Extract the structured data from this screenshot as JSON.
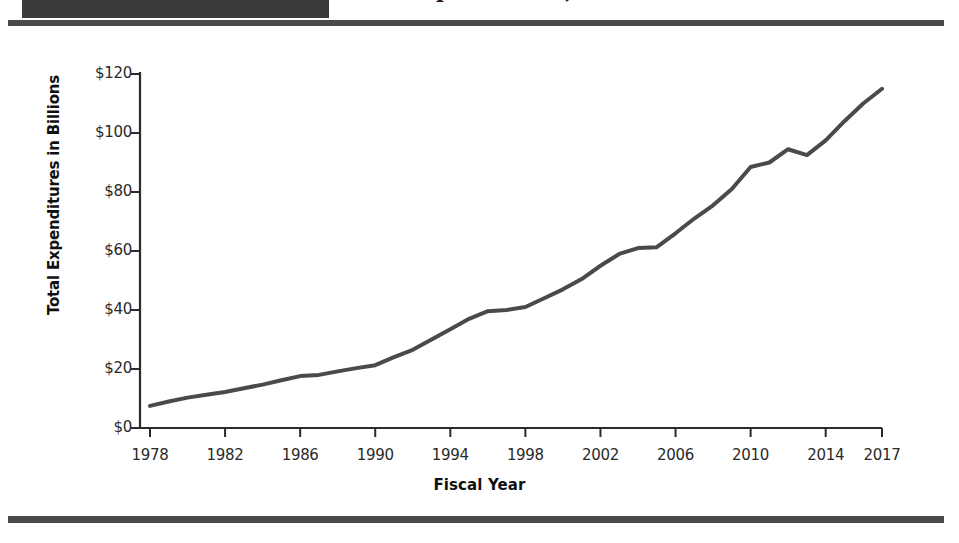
{
  "document": {
    "header_band_label": "",
    "partial_title": "Total Expenditures, Fiscal Years 1978-2017",
    "rule_color": "#4a4a4a"
  },
  "chart_data": {
    "type": "line",
    "title": "",
    "xlabel": "Fiscal Year",
    "ylabel": "Total Expenditures in Billions",
    "xlim": [
      1978,
      2017
    ],
    "ylim": [
      0,
      120
    ],
    "grid": false,
    "legend": "none",
    "line_color": "#4a4a4a",
    "y_ticks": [
      0,
      20,
      40,
      60,
      80,
      100,
      120
    ],
    "y_tick_labels": [
      "$0",
      "$20",
      "$40",
      "$60",
      "$80",
      "$100",
      "$120"
    ],
    "x_ticks": [
      1978,
      1982,
      1986,
      1990,
      1994,
      1998,
      2002,
      2006,
      2010,
      2014,
      2017
    ],
    "x_tick_labels": [
      "1978",
      "1982",
      "1986",
      "1990",
      "1994",
      "1998",
      "2002",
      "2006",
      "2010",
      "2014",
      "2017"
    ],
    "x": [
      1978,
      1979,
      1980,
      1981,
      1982,
      1983,
      1984,
      1985,
      1986,
      1987,
      1988,
      1989,
      1990,
      1991,
      1992,
      1993,
      1994,
      1995,
      1996,
      1997,
      1998,
      1999,
      2000,
      2001,
      2002,
      2003,
      2004,
      2005,
      2006,
      2007,
      2008,
      2009,
      2010,
      2011,
      2012,
      2013,
      2014,
      2015,
      2016,
      2017
    ],
    "values": [
      7.5,
      9.0,
      10.3,
      11.3,
      12.2,
      13.5,
      14.7,
      16.2,
      17.6,
      18.0,
      19.2,
      20.3,
      21.3,
      24.0,
      26.5,
      30.0,
      33.5,
      37.0,
      39.6,
      40.0,
      41.0,
      44.0,
      47.0,
      50.5,
      55.0,
      59.0,
      61.0,
      61.3,
      66.0,
      71.0,
      75.5,
      81.0,
      88.5,
      90.0,
      94.5,
      92.5,
      97.5,
      104.0,
      110.0,
      115.0
    ]
  }
}
